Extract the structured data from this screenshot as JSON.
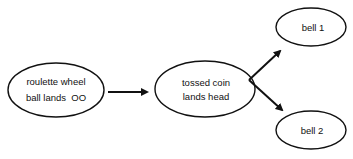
{
  "diagram": {
    "nodes": [
      {
        "id": "roulette",
        "line1": "roulette wheel",
        "line2": "ball lands  OO"
      },
      {
        "id": "coin",
        "line1": "tossed coin",
        "line2": "lands head"
      },
      {
        "id": "bell1",
        "label": "bell 1"
      },
      {
        "id": "bell2",
        "label": "bell 2"
      }
    ],
    "edges": [
      {
        "from": "roulette",
        "to": "coin"
      },
      {
        "from": "coin",
        "to": "bell1"
      },
      {
        "from": "coin",
        "to": "bell2"
      }
    ],
    "colors": {
      "stroke": "#111111",
      "background": "#ffffff"
    }
  }
}
